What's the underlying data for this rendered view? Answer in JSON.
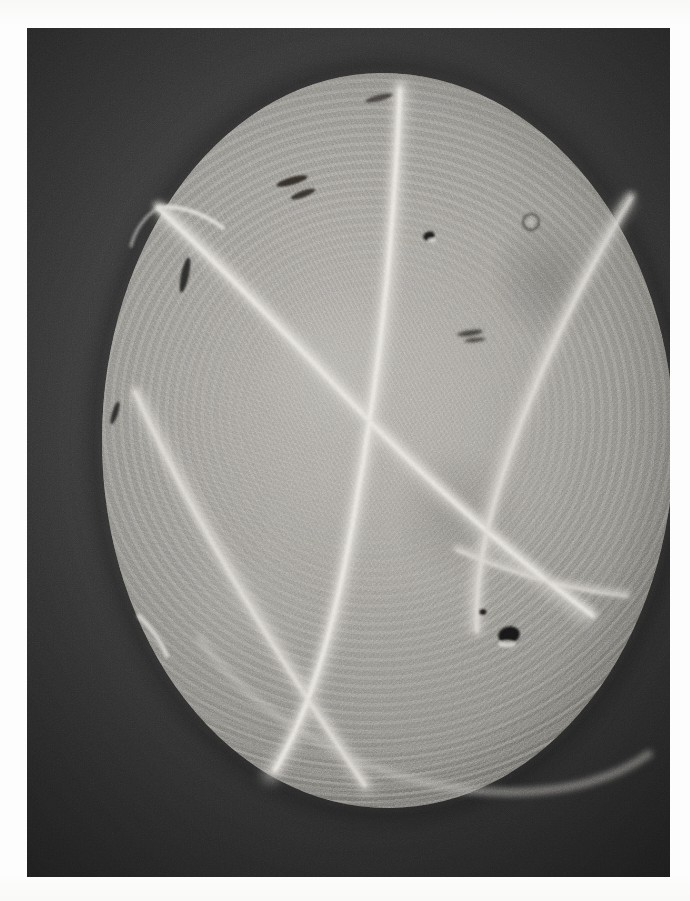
{
  "plate": {
    "kind": "photographic-micrograph",
    "caption": "",
    "page_background_color": "#ffffff",
    "frame": {
      "background_color": "#3a3a3a",
      "x": 27,
      "y": 28,
      "width": 643,
      "height": 849
    }
  },
  "specimen": {
    "label": "circular frustule",
    "center_x": 388,
    "center_y": 440,
    "width": 572,
    "height": 735,
    "fill_color": "#aeaba5",
    "rim_color": "#6e6c68",
    "description": "roughly circular light-gray disc with concentric ring striations and fine radial cross-hatch texture"
  },
  "features": {
    "filaments": [
      {
        "name": "filament-top-vertical",
        "bright_color": "#d9d7d2"
      },
      {
        "name": "filament-upper-left-spur",
        "bright_color": "#d5d3ce"
      },
      {
        "name": "filament-diagonal-major",
        "bright_color": "#d8d6d1"
      },
      {
        "name": "filament-left-descending",
        "bright_color": "#cfcdc8"
      },
      {
        "name": "filament-lower-left-exit",
        "bright_color": "#d2d0cb"
      },
      {
        "name": "filament-right-descending",
        "bright_color": "#cecbc6"
      },
      {
        "name": "filament-lower-right-branch",
        "bright_color": "#cbc9c4"
      },
      {
        "name": "filament-rim-arc-lower",
        "bright_color": "#c9c7c2"
      }
    ],
    "dark_inclusions": [
      {
        "name": "inclusion-upper-small",
        "x": 429,
        "y": 236,
        "w": 11,
        "h": 9,
        "color": "#1f1d1b"
      },
      {
        "name": "inclusion-ring",
        "x": 531,
        "y": 222,
        "w": 17,
        "h": 16,
        "color": "#4a4845"
      },
      {
        "name": "inclusion-mid-streak",
        "x": 470,
        "y": 333,
        "w": 26,
        "h": 7,
        "color": "#2b2927"
      },
      {
        "name": "inclusion-lower-dot",
        "x": 483,
        "y": 612,
        "w": 7,
        "h": 6,
        "color": "#201e1c"
      },
      {
        "name": "inclusion-lower-blob",
        "x": 509,
        "y": 635,
        "w": 22,
        "h": 17,
        "color": "#171514"
      },
      {
        "name": "inclusion-left-slit",
        "x": 115,
        "y": 413,
        "w": 9,
        "h": 24,
        "color": "#232120"
      },
      {
        "name": "inclusion-upper-left-slit",
        "x": 185,
        "y": 275,
        "w": 10,
        "h": 36,
        "color": "#222020"
      },
      {
        "name": "inclusion-top-slit",
        "x": 292,
        "y": 181,
        "w": 32,
        "h": 12,
        "color": "#26201f"
      }
    ]
  },
  "render": {
    "grain_intensity": "heavy",
    "medium": "halftone print"
  }
}
